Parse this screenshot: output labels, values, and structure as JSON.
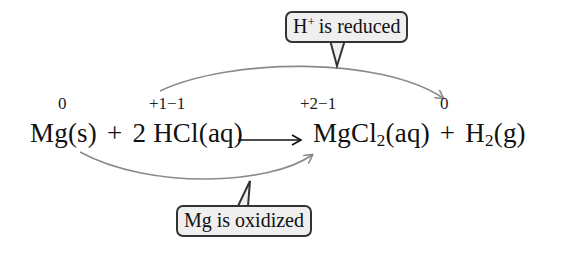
{
  "diagram": {
    "type": "redox-reaction-annotation",
    "oxidation_numbers": [
      {
        "species": "Mg",
        "value": "0"
      },
      {
        "species": "HCl",
        "value": "+1−1"
      },
      {
        "species": "MgCl2",
        "value": "+2−1"
      },
      {
        "species": "H2",
        "value": "0"
      }
    ],
    "equation": {
      "reactant_1": "Mg(s)",
      "plus_1": "+",
      "coefficient_2": "2",
      "reactant_2": "HCl(aq)",
      "product_1_base": "MgCl",
      "product_1_sub": "2",
      "product_1_state": "(aq)",
      "plus_2": "+",
      "product_2_base": "H",
      "product_2_sub": "2",
      "product_2_state": "(g)"
    },
    "callouts": {
      "reduced": {
        "ion": "H",
        "charge": "+",
        "text": "is reduced"
      },
      "oxidized": {
        "text": "Mg is oxidized"
      }
    },
    "colors": {
      "arrow": "#8a8a8a",
      "callout_fill": "#efefef",
      "callout_border": "#333333",
      "text": "#111111"
    }
  }
}
